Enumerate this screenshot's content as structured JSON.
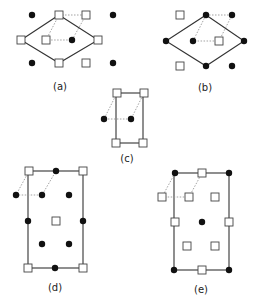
{
  "figure": {
    "panels": [
      {
        "id": "a",
        "label": "(a)"
      },
      {
        "id": "b",
        "label": "(b)"
      },
      {
        "id": "c",
        "label": "(c)"
      },
      {
        "id": "d",
        "label": "(d)"
      },
      {
        "id": "e",
        "label": "(e)"
      }
    ],
    "legend_symbols": {
      "filled_circle": "atom type A (black dot)",
      "open_square": "atom type B (white square)"
    }
  }
}
